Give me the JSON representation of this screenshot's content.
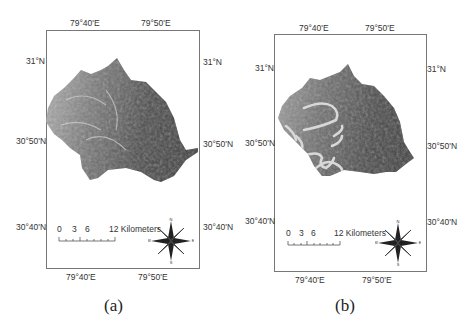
{
  "figure": {
    "panels": [
      {
        "id": "a",
        "caption": "(a)",
        "top_labels": [
          "79°40'E",
          "79°50'E"
        ],
        "bottom_labels": [
          "79°40'E",
          "79°50'E"
        ],
        "left_labels": [
          "31°N",
          "30°50'N",
          "30°40'N"
        ],
        "right_labels": [
          "31°N",
          "30°50'N",
          "30°40'N"
        ],
        "scale_bar": {
          "ticks": [
            "0",
            "3",
            "6"
          ],
          "end_label": "12 Kilometers"
        },
        "north_arrow": {
          "n": "N",
          "s": "S",
          "e": "E",
          "w": "W"
        },
        "map_style": "hillshade DEM of catchment"
      },
      {
        "id": "b",
        "caption": "(b)",
        "top_labels": [
          "79°40'E",
          "79°50'E"
        ],
        "bottom_labels": [
          "79°40'E",
          "79°50'E"
        ],
        "left_labels": [
          "31°N",
          "30°50'N",
          "30°40'N"
        ],
        "right_labels": [
          "31°N",
          "30°50'N",
          "30°40'N"
        ],
        "scale_bar": {
          "ticks": [
            "0",
            "3",
            "6"
          ],
          "end_label": "12 Kilometers"
        },
        "north_arrow": {
          "n": "N",
          "s": "S",
          "e": "E",
          "w": "W"
        },
        "map_style": "hillshade DEM with glacier outlines highlighted"
      }
    ]
  }
}
